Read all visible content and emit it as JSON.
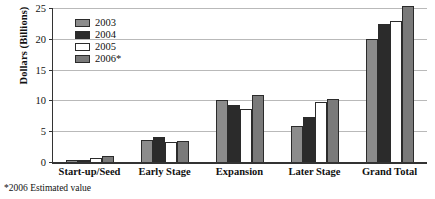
{
  "chart_data": {
    "type": "bar",
    "title": "",
    "xlabel": "",
    "ylabel": "Dollars (Billions)",
    "ylim": [
      0,
      25
    ],
    "yticks": [
      0,
      5,
      10,
      15,
      20,
      25
    ],
    "grid": true,
    "legend_position": "upper-left-inside",
    "categories": [
      "Start-up/Seed",
      "Early Stage",
      "Expansion",
      "Later Stage",
      "Grand Total"
    ],
    "series": [
      {
        "name": "2003",
        "color": "#8c8c8c",
        "values": [
          0.3,
          3.5,
          10.1,
          5.8,
          19.9
        ]
      },
      {
        "name": "2004",
        "color": "#2b2b2b",
        "values": [
          0.4,
          4.0,
          9.3,
          7.3,
          22.4
        ]
      },
      {
        "name": "2005",
        "color": "#ffffff",
        "values": [
          0.7,
          3.2,
          8.6,
          9.8,
          22.9
        ]
      },
      {
        "name": "2006*",
        "color": "#7a7a7a",
        "values": [
          0.9,
          3.4,
          10.8,
          10.3,
          25.4
        ]
      }
    ],
    "footnote": "*2006 Estimated value"
  }
}
